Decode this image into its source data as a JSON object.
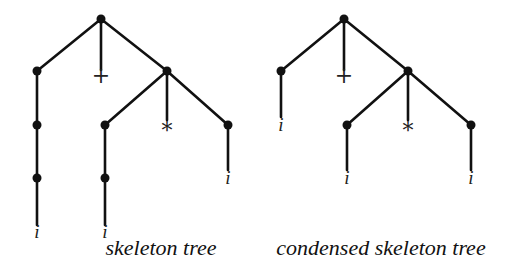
{
  "figures": [
    {
      "id": "skeleton",
      "caption": "skeleton tree",
      "caption_pos": [
        161,
        255
      ],
      "nodes": [
        {
          "x": 101,
          "y": 19
        },
        {
          "x": 37,
          "y": 71
        },
        {
          "x": 167,
          "y": 71
        },
        {
          "x": 37,
          "y": 125
        },
        {
          "x": 37,
          "y": 178
        },
        {
          "x": 105,
          "y": 125
        },
        {
          "x": 105,
          "y": 178
        },
        {
          "x": 228,
          "y": 125
        }
      ],
      "edges": [
        [
          101,
          19,
          37,
          71
        ],
        [
          101,
          19,
          101,
          70
        ],
        [
          101,
          19,
          167,
          71
        ],
        [
          37,
          71,
          37,
          125
        ],
        [
          37,
          125,
          37,
          178
        ],
        [
          37,
          178,
          37,
          225
        ],
        [
          167,
          71,
          105,
          125
        ],
        [
          167,
          71,
          167,
          120
        ],
        [
          167,
          71,
          228,
          125
        ],
        [
          105,
          125,
          105,
          178
        ],
        [
          105,
          178,
          105,
          225
        ],
        [
          228,
          125,
          228,
          170
        ]
      ],
      "symbols": [
        {
          "text": "+",
          "x": 101,
          "y": 83
        },
        {
          "text": "*",
          "x": 167,
          "y": 138
        }
      ],
      "leaves": [
        {
          "text": "i",
          "x": 37,
          "y": 238
        },
        {
          "text": "i",
          "x": 105,
          "y": 238
        },
        {
          "text": "i",
          "x": 228,
          "y": 184
        }
      ]
    },
    {
      "id": "condensed",
      "caption": "condensed skeleton tree",
      "caption_pos": [
        381,
        255
      ],
      "nodes": [
        {
          "x": 344,
          "y": 19
        },
        {
          "x": 281,
          "y": 71
        },
        {
          "x": 408,
          "y": 71
        },
        {
          "x": 347,
          "y": 125
        },
        {
          "x": 471,
          "y": 125
        }
      ],
      "edges": [
        [
          344,
          19,
          281,
          71
        ],
        [
          344,
          19,
          344,
          70
        ],
        [
          344,
          19,
          408,
          71
        ],
        [
          281,
          71,
          281,
          117
        ],
        [
          408,
          71,
          347,
          125
        ],
        [
          408,
          71,
          408,
          120
        ],
        [
          408,
          71,
          471,
          125
        ],
        [
          347,
          125,
          347,
          170
        ],
        [
          471,
          125,
          471,
          170
        ]
      ],
      "symbols": [
        {
          "text": "+",
          "x": 344,
          "y": 83
        },
        {
          "text": "*",
          "x": 408,
          "y": 138
        }
      ],
      "leaves": [
        {
          "text": "i",
          "x": 281,
          "y": 131
        },
        {
          "text": "i",
          "x": 347,
          "y": 184
        },
        {
          "text": "i",
          "x": 471,
          "y": 184
        }
      ]
    }
  ]
}
